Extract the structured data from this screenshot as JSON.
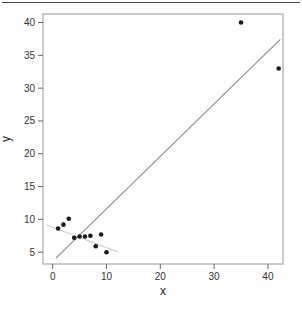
{
  "page": {
    "background": "#ffffff",
    "top_separator_color": "#4a4a4a"
  },
  "chart_data": {
    "type": "scatter",
    "title": "",
    "xlabel": "x",
    "ylabel": "y",
    "x_ticks": [
      0,
      10,
      20,
      30,
      40
    ],
    "y_ticks": [
      5,
      10,
      15,
      20,
      25,
      30,
      35,
      40
    ],
    "xlim": [
      -1.8,
      42.8
    ],
    "ylim": [
      3.2,
      41.3
    ],
    "grid": false,
    "legend": false,
    "point_color": "#1a1a1a",
    "point_radius": 2.3,
    "axis_color": "#999999",
    "tick_color": "#666666",
    "points": [
      [
        1,
        8.6
      ],
      [
        2,
        9.2
      ],
      [
        3,
        10.1
      ],
      [
        4,
        7.2
      ],
      [
        5,
        7.4
      ],
      [
        6,
        7.4
      ],
      [
        7,
        7.5
      ],
      [
        8,
        5.9
      ],
      [
        9,
        7.7
      ],
      [
        10,
        5.0
      ],
      [
        35,
        40
      ],
      [
        42,
        33
      ]
    ],
    "regression_lines": [
      {
        "name": "fit-all-points",
        "slope": 0.8,
        "intercept": 3.6,
        "x_start": 0.6,
        "x_end": 42.3,
        "color": "#8a8a8a",
        "width": 1.1
      },
      {
        "name": "fit-cluster-only",
        "slope": -0.31,
        "intercept": 8.8,
        "x_start": -1.2,
        "x_end": 12.2,
        "color": "#c6c6c6",
        "width": 1.0
      }
    ]
  }
}
